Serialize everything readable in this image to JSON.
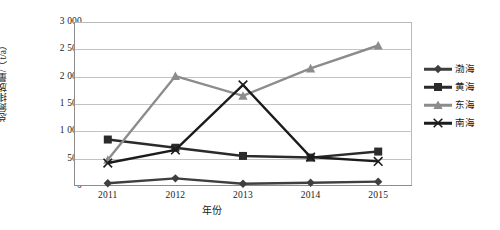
{
  "chart_data": {
    "type": "line",
    "title": "",
    "subtitle": "",
    "xlabel": "年份",
    "ylabel": "总氮排放量/（t/a）",
    "categories": [
      "2011",
      "2012",
      "2013",
      "2014",
      "2015"
    ],
    "ylim": [
      0,
      3000
    ],
    "ytick_step": 500,
    "ytick_labels": [
      "3 000",
      "2 500",
      "2 000",
      "1 500",
      "1 000",
      "500",
      "0"
    ],
    "ytick_values": [
      3000,
      2500,
      2000,
      1500,
      1000,
      500,
      0
    ],
    "grid": "horizontal",
    "legend_position": "right",
    "series": [
      {
        "name": "渤海",
        "marker": "diamond",
        "color": "#3f3f3f",
        "values": [
          50,
          140,
          40,
          60,
          80
        ]
      },
      {
        "name": "黄海",
        "marker": "square",
        "color": "#2b2b2b",
        "values": [
          850,
          700,
          550,
          520,
          630
        ]
      },
      {
        "name": "东海",
        "marker": "triangle",
        "color": "#8c8c8c",
        "values": [
          480,
          2010,
          1650,
          2150,
          2570
        ]
      },
      {
        "name": "南海",
        "marker": "x",
        "color": "#1c1c1c",
        "values": [
          420,
          660,
          1850,
          530,
          450
        ]
      }
    ]
  },
  "legend": {
    "items": [
      {
        "label": "渤海"
      },
      {
        "label": "黄海"
      },
      {
        "label": "东海"
      },
      {
        "label": "南海"
      }
    ]
  },
  "axes": {
    "y_title": "总氮排放量/（t/a）",
    "x_title": "年份"
  }
}
